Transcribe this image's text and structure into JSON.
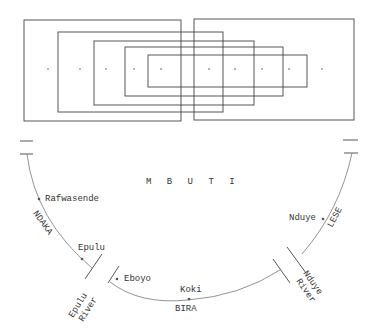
{
  "diagram": {
    "title_label": "M B U T I",
    "boxes_count": 6,
    "center_dots_count": 10,
    "groups": {
      "left": "NDAKA",
      "bottom": "BIRA",
      "right": "LESE"
    },
    "places": [
      {
        "id": "rafwasende",
        "label": "Rafwasende"
      },
      {
        "id": "epulu",
        "label": "Epulu"
      },
      {
        "id": "eboyo",
        "label": "Eboyo"
      },
      {
        "id": "koki",
        "label": "Koki"
      },
      {
        "id": "nduye",
        "label": "Nduye"
      }
    ],
    "rivers": [
      {
        "id": "epulu-river",
        "line1": "Epulu",
        "line2": "River"
      },
      {
        "id": "nduye-river",
        "line1": "Nduye",
        "line2": "River"
      }
    ]
  }
}
